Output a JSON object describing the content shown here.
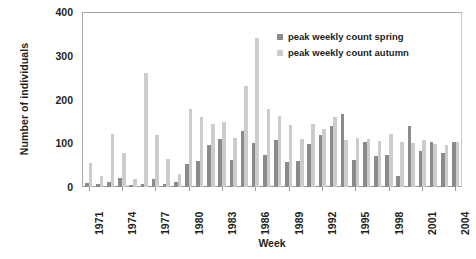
{
  "chart_data": {
    "type": "bar",
    "title": "",
    "xlabel": "Week",
    "ylabel": "Number of individuals",
    "ylim": [
      0,
      400
    ],
    "yticks": [
      0,
      100,
      200,
      300,
      400
    ],
    "grid": false,
    "legend_position": "top-right",
    "categories": [
      "1971",
      "1972",
      "1973",
      "1974",
      "1975",
      "1976",
      "1977",
      "1978",
      "1979",
      "1980",
      "1981",
      "1982",
      "1983",
      "1984",
      "1985",
      "1986",
      "1987",
      "1988",
      "1989",
      "1990",
      "1991",
      "1992",
      "1993",
      "1994",
      "1995",
      "1996",
      "1997",
      "1998",
      "1999",
      "2000",
      "2001",
      "2002",
      "2003",
      "2004"
    ],
    "xtick_labels": [
      "1971",
      "1974",
      "1977",
      "1980",
      "1983",
      "1986",
      "1989",
      "1992",
      "1995",
      "1998",
      "2001",
      "2004"
    ],
    "xtick_indices": [
      0,
      3,
      6,
      9,
      12,
      15,
      18,
      21,
      24,
      27,
      30,
      33
    ],
    "series": [
      {
        "name": "peak weekly count spring",
        "color": "#8b8b8b",
        "values": [
          10,
          8,
          12,
          20,
          4,
          6,
          18,
          8,
          12,
          52,
          60,
          96,
          110,
          62,
          128,
          100,
          74,
          108,
          57,
          60,
          98,
          118,
          140,
          168,
          62,
          104,
          72,
          74,
          26,
          140,
          82,
          102,
          78,
          104
        ]
      },
      {
        "name": "peak weekly count autumn",
        "color": "#cccccc",
        "values": [
          56,
          25,
          122,
          78,
          18,
          260,
          118,
          64,
          30,
          178,
          160,
          145,
          148,
          112,
          232,
          340,
          178,
          162,
          142,
          110,
          145,
          132,
          160,
          108,
          112,
          110,
          105,
          122,
          102,
          100,
          108,
          98,
          96,
          102
        ]
      }
    ]
  },
  "legend": {
    "entries": [
      {
        "label": "peak weekly count spring",
        "color": "#8b8b8b"
      },
      {
        "label": "peak weekly count autumn",
        "color": "#cccccc"
      }
    ]
  }
}
